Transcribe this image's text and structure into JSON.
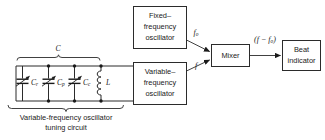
{
  "diagram": {
    "colors": {
      "stroke": "#2b2b2b",
      "text": "#1a1a1a",
      "background": "#ffffff"
    },
    "boxes": [
      {
        "id": "fixed-oscillator",
        "line1": "Fixed–",
        "line2": "frequency",
        "line3": "oscillator"
      },
      {
        "id": "variable-oscillator",
        "line1": "Variable–",
        "line2": "frequency",
        "line3": "oscillator"
      },
      {
        "id": "mixer",
        "line1": "Mixer",
        "line2": "",
        "line3": ""
      },
      {
        "id": "beat-indicator",
        "line1": "Beat",
        "line2": "indicator",
        "line3": ""
      }
    ],
    "signals": {
      "fixed_output": "f",
      "fixed_output_sub": "o",
      "variable_output": "f",
      "mixer_output_open": "(",
      "mixer_output_f": "f",
      "mixer_output_minus": " − ",
      "mixer_output_f2": "f",
      "mixer_output_sub": "o",
      "mixer_output_close": ")"
    },
    "circuit": {
      "total_capacitance_label": "C",
      "components": [
        {
          "id": "capacitor-range",
          "symbol": "C",
          "subscript": "r"
        },
        {
          "id": "capacitor-padder",
          "symbol": "C",
          "subscript": "p"
        },
        {
          "id": "capacitor-trimmer",
          "symbol": "C",
          "subscript": "c"
        },
        {
          "id": "inductor",
          "symbol": "L",
          "subscript": ""
        }
      ],
      "caption_line1": "Variable-frequency oscillator",
      "caption_line2": "tuning circuit"
    }
  }
}
